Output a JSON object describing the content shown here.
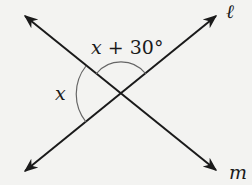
{
  "diagram": {
    "title": "",
    "lines": [
      {
        "name": "ℓ",
        "from": [
          25,
          171
        ],
        "to": [
          216,
          16
        ],
        "arrows": "both"
      },
      {
        "name": "m",
        "from": [
          25,
          16
        ],
        "to": [
          216,
          170
        ],
        "arrows": "both"
      }
    ],
    "intersection": [
      121,
      94
    ],
    "angles": [
      {
        "label_var": "x",
        "label_rest": " + 30°",
        "position": "top",
        "arc_radius": 32
      },
      {
        "label_var": "x",
        "position": "left",
        "arc_radius": 45
      }
    ],
    "labels": {
      "line_l": "ℓ",
      "line_m": "m",
      "angle_top_var": "x",
      "angle_top_rest": " + 30°",
      "angle_left": "x"
    },
    "colors": {
      "background": "#f3f3f1",
      "line": "#1a1a1a",
      "arc": "#666666"
    }
  }
}
